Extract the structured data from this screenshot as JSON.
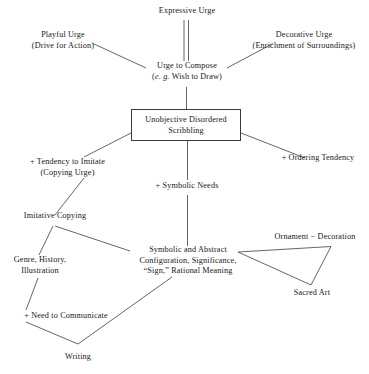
{
  "diagram": {
    "background_color": "#ffffff",
    "line_color": "#555555",
    "text_color": "#171717",
    "nodes": {
      "expressive_urge": {
        "line1": "Expressive Urge"
      },
      "playful_urge": {
        "line1": "Playful Urge",
        "line2": "(Drive for Action)"
      },
      "decorative_urge": {
        "line1": "Decorative Urge",
        "line2": "(Enrichment of Surroundings)"
      },
      "urge_to_compose": {
        "line1": "Urge to Compose",
        "line2_italic": "e. g.",
        "line2_rest": " Wish to Draw",
        "line2_open": "(",
        "line2_close": ")"
      },
      "unobjective_scribbling": {
        "line1": "Unobjective Disordered",
        "line2": "Scribbling"
      },
      "tendency_to_imitate": {
        "line1": "+ Tendency to Imitate",
        "line2": "(Copying Urge)"
      },
      "ordering_tendency": {
        "line1": "+ Ordering Tendency"
      },
      "symbolic_needs": {
        "line1": "+ Symbolic Needs"
      },
      "imitative_copying": {
        "line1": "Imitative Copying"
      },
      "genre_history": {
        "line1": "Genre, History,",
        "line2": "Illustration"
      },
      "symbolic_abstract": {
        "line1": "Symbolic and Abstract",
        "line2": "Configuration, Significance,",
        "line3": "“Sign,” Rational Meaning"
      },
      "ornament_decoration": {
        "line1": "Ornament − Decoration"
      },
      "sacred_art": {
        "line1": "Sacred Art"
      },
      "need_to_communicate": {
        "line1": "+ Need to Communicate"
      },
      "writing": {
        "line1": "Writing"
      }
    }
  }
}
